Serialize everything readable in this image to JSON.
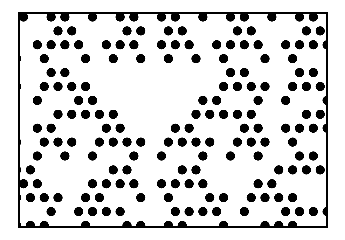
{
  "figure": {
    "caption": "",
    "background_color": "#ffffff",
    "dot_color": "#000000",
    "frame": {
      "border_color": "#000000",
      "border_width": 2,
      "x": 18,
      "y": 12,
      "width": 310,
      "height": 216
    }
  },
  "chart_data": {
    "type": "scatter",
    "subtitle": "",
    "xlabel": "",
    "ylabel": "",
    "grid": false,
    "legend": null,
    "annotations": [],
    "lattice": {
      "description": "Offset (staggered) triangular lattice of filled circular dots",
      "columns": 23,
      "rows": 16,
      "col_spacing": 13.8,
      "row_spacing": 13.9,
      "row_offset": 6.9,
      "dot_diameter": 9.2,
      "origin_x": 3.5,
      "origin_y": 3.0
    },
    "generator": {
      "rule": 90,
      "rule_description": "cell = left XOR right (Pascal's triangle mod 2)",
      "wrap": true,
      "period_rows": 16,
      "seed_row": [
        1,
        0,
        1,
        1,
        0,
        1,
        0,
        1,
        1,
        0,
        1,
        1,
        0,
        1,
        0,
        1,
        1,
        0,
        1,
        0,
        1,
        1,
        0
      ],
      "phase_shift_per_row": 0
    },
    "xlim": [
      0,
      23
    ],
    "ylim": [
      0,
      16
    ],
    "points": []
  }
}
